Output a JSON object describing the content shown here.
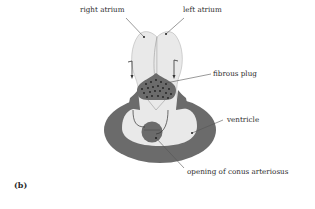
{
  "figure": {
    "panel_label": "(b)",
    "labels": {
      "right_atrium": "right atrium",
      "left_atrium": "left atrium",
      "fibrous_plug": "fibrous plug",
      "ventricle": "ventricle",
      "conus_opening": "opening of conus arteriosus"
    },
    "colors": {
      "dark_tissue": "#6b6b6b",
      "light_chamber": "#e9e9e9",
      "outline": "#8a8a8a",
      "leader_line": "#555555",
      "plug_dots": "#1e1e1e"
    }
  }
}
